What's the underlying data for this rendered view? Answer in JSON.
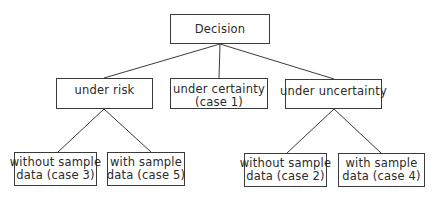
{
  "diagram": {
    "root": {
      "label": "Decision"
    },
    "level2": [
      {
        "id": "risk",
        "lines": [
          "under risk"
        ]
      },
      {
        "id": "certainty",
        "lines": [
          "under certainty",
          "(case 1)"
        ]
      },
      {
        "id": "uncertainty",
        "lines": [
          "under uncertainty"
        ]
      }
    ],
    "leaves": [
      {
        "parent": "risk",
        "lines": [
          "without sample",
          "data (case 3)"
        ]
      },
      {
        "parent": "risk",
        "lines": [
          "with sample",
          "data (case 5)"
        ]
      },
      {
        "parent": "uncertainty",
        "lines": [
          "without sample",
          "data (case 2)"
        ]
      },
      {
        "parent": "uncertainty",
        "lines": [
          "with sample",
          "data (case 4)"
        ]
      }
    ],
    "colors": {
      "line": "#3a3a3a",
      "text": "#2a2a2a",
      "background": "#ffffff"
    }
  }
}
